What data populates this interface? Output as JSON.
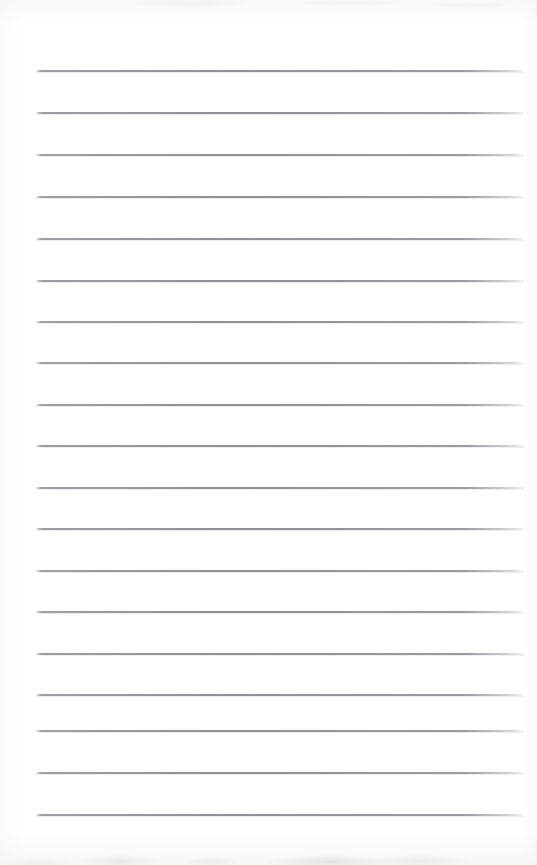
{
  "document": {
    "kind": "lined-notepad-page",
    "title": "Lined Notepad Page",
    "content_text": "",
    "page_width": 537,
    "page_height": 865,
    "background_color": "#ffffff",
    "rule_color": "#8f8f96",
    "rule_count": 19,
    "rule_left_x": 36,
    "rule_right_x": 524,
    "rule_thickness": 2,
    "rule_spacing": 42,
    "first_rule_y": 70,
    "rules": [
      {
        "index": 1,
        "y": 70,
        "text": ""
      },
      {
        "index": 2,
        "y": 112,
        "text": ""
      },
      {
        "index": 3,
        "y": 154,
        "text": ""
      },
      {
        "index": 4,
        "y": 196,
        "text": ""
      },
      {
        "index": 5,
        "y": 238,
        "text": ""
      },
      {
        "index": 6,
        "y": 280,
        "text": ""
      },
      {
        "index": 7,
        "y": 321,
        "text": ""
      },
      {
        "index": 8,
        "y": 362,
        "text": ""
      },
      {
        "index": 9,
        "y": 404,
        "text": ""
      },
      {
        "index": 10,
        "y": 445,
        "text": ""
      },
      {
        "index": 11,
        "y": 487,
        "text": ""
      },
      {
        "index": 12,
        "y": 528,
        "text": ""
      },
      {
        "index": 13,
        "y": 570,
        "text": ""
      },
      {
        "index": 14,
        "y": 611,
        "text": ""
      },
      {
        "index": 15,
        "y": 653,
        "text": ""
      },
      {
        "index": 16,
        "y": 694,
        "text": ""
      },
      {
        "index": 17,
        "y": 730,
        "text": ""
      },
      {
        "index": 18,
        "y": 772,
        "text": ""
      },
      {
        "index": 19,
        "y": 814,
        "text": ""
      }
    ]
  }
}
